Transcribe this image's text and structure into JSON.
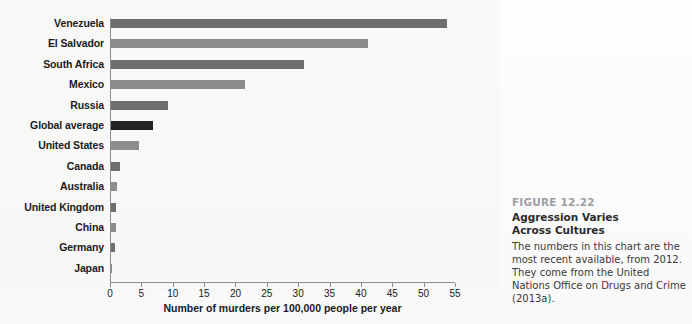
{
  "chart_data": {
    "type": "bar",
    "orientation": "horizontal",
    "title": "",
    "xlabel": "Number of murders per 100,000 people per year",
    "ylabel": "",
    "xlim": [
      0,
      55
    ],
    "xticks": [
      0,
      5,
      10,
      15,
      20,
      25,
      30,
      35,
      40,
      45,
      50,
      55
    ],
    "grid": false,
    "legend": "none",
    "categories": [
      "Venezuela",
      "El Salvador",
      "South Africa",
      "Mexico",
      "Russia",
      "Global average",
      "United States",
      "Canada",
      "Australia",
      "United Kingdom",
      "China",
      "Germany",
      "Japan"
    ],
    "values": [
      53.7,
      41.2,
      31.0,
      21.5,
      9.2,
      6.9,
      4.7,
      1.6,
      1.1,
      1.0,
      1.0,
      0.8,
      0.3
    ],
    "bar_colors": [
      "#6e6e6e",
      "#8d8d8d",
      "#6e6e6e",
      "#8d8d8d",
      "#6e6e6e",
      "#232323",
      "#8d8d8d",
      "#6e6e6e",
      "#8d8d8d",
      "#6e6e6e",
      "#8d8d8d",
      "#6e6e6e",
      "#8d8d8d"
    ],
    "highlight_category": "Global average",
    "highlight_color": "#232323"
  },
  "caption": {
    "figure_number": "FIGURE 12.22",
    "title_line_1": "Aggression Varies",
    "title_line_2": "Across Cultures",
    "body": "The numbers in this chart are the most recent available, from 2012. They come from the United Nations Office on Drugs and Crime (2013a).",
    "number_color": "#9aa0a6"
  },
  "axis": {
    "line_color": "#8d8d8d"
  }
}
